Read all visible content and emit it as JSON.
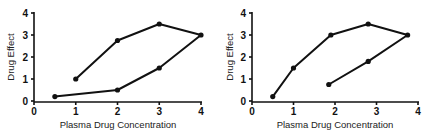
{
  "chart_data": [
    {
      "type": "line",
      "title": "",
      "xlabel": "Plasma Drug Concentration",
      "ylabel": "Drug Effect",
      "xlim": [
        0,
        4
      ],
      "ylim": [
        0,
        4
      ],
      "x_ticks": [
        "0",
        "1",
        "2",
        "3",
        "4"
      ],
      "y_ticks": [
        "0",
        "1",
        "2",
        "3",
        "4"
      ],
      "grid": false,
      "series": [
        {
          "name": "hysteresis loop",
          "points": [
            [
              1,
              1
            ],
            [
              2,
              2.75
            ],
            [
              3,
              3.5
            ],
            [
              4,
              3
            ],
            [
              3,
              1.5
            ],
            [
              2,
              0.5
            ],
            [
              0.5,
              0.2
            ]
          ]
        }
      ]
    },
    {
      "type": "line",
      "title": "",
      "xlabel": "Plasma Drug Concentration",
      "ylabel": "Drug Effect",
      "xlim": [
        0,
        4
      ],
      "ylim": [
        0,
        4
      ],
      "x_ticks": [
        "0",
        "1",
        "2",
        "3",
        "4"
      ],
      "y_ticks": [
        "0",
        "1",
        "2",
        "3",
        "4"
      ],
      "grid": false,
      "series": [
        {
          "name": "hysteresis loop",
          "points": [
            [
              0.5,
              0.2
            ],
            [
              1,
              1.5
            ],
            [
              1.9,
              3
            ],
            [
              2.8,
              3.5
            ],
            [
              3.75,
              3
            ],
            [
              2.8,
              1.8
            ],
            [
              1.85,
              0.75
            ]
          ]
        }
      ]
    }
  ]
}
